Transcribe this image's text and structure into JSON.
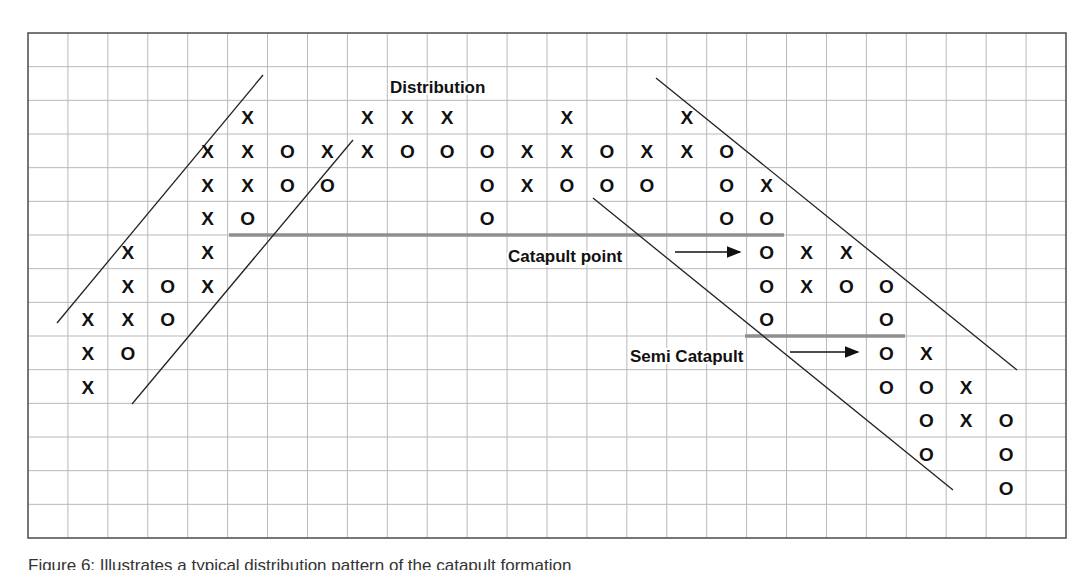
{
  "chart_data": {
    "type": "point-and-figure",
    "title": "",
    "grid": {
      "left": 28,
      "top": 33,
      "right": 1066,
      "bottom": 538,
      "columns": 26,
      "rows": 15,
      "line_color": "#b9b9b9",
      "border_color": "#555555"
    },
    "columns": [
      {
        "col": 1,
        "marks": [
          {
            "r": 8,
            "m": "X"
          },
          {
            "r": 9,
            "m": "X"
          },
          {
            "r": 10,
            "m": "X"
          }
        ]
      },
      {
        "col": 2,
        "marks": [
          {
            "r": 6,
            "m": "X"
          },
          {
            "r": 7,
            "m": "X"
          },
          {
            "r": 8,
            "m": "X"
          },
          {
            "r": 9,
            "m": "O"
          }
        ]
      },
      {
        "col": 3,
        "marks": [
          {
            "r": 7,
            "m": "O"
          },
          {
            "r": 8,
            "m": "O"
          }
        ]
      },
      {
        "col": 4,
        "marks": [
          {
            "r": 3,
            "m": "X"
          },
          {
            "r": 4,
            "m": "X"
          },
          {
            "r": 5,
            "m": "X"
          },
          {
            "r": 6,
            "m": "X"
          },
          {
            "r": 7,
            "m": "X"
          }
        ]
      },
      {
        "col": 5,
        "marks": [
          {
            "r": 2,
            "m": "X"
          },
          {
            "r": 3,
            "m": "X"
          },
          {
            "r": 4,
            "m": "X"
          },
          {
            "r": 5,
            "m": "O"
          }
        ]
      },
      {
        "col": 6,
        "marks": [
          {
            "r": 3,
            "m": "O"
          },
          {
            "r": 4,
            "m": "O"
          }
        ]
      },
      {
        "col": 7,
        "marks": [
          {
            "r": 3,
            "m": "X"
          },
          {
            "r": 4,
            "m": "O"
          }
        ]
      },
      {
        "col": 8,
        "marks": [
          {
            "r": 2,
            "m": "X"
          },
          {
            "r": 3,
            "m": "X"
          }
        ]
      },
      {
        "col": 9,
        "marks": [
          {
            "r": 2,
            "m": "X"
          },
          {
            "r": 3,
            "m": "O"
          }
        ]
      },
      {
        "col": 10,
        "marks": [
          {
            "r": 2,
            "m": "X"
          },
          {
            "r": 3,
            "m": "O"
          }
        ]
      },
      {
        "col": 11,
        "marks": [
          {
            "r": 3,
            "m": "O"
          },
          {
            "r": 4,
            "m": "O"
          },
          {
            "r": 5,
            "m": "O"
          }
        ]
      },
      {
        "col": 12,
        "marks": [
          {
            "r": 3,
            "m": "X"
          },
          {
            "r": 4,
            "m": "X"
          }
        ]
      },
      {
        "col": 13,
        "marks": [
          {
            "r": 2,
            "m": "X"
          },
          {
            "r": 3,
            "m": "X"
          },
          {
            "r": 4,
            "m": "O"
          }
        ]
      },
      {
        "col": 14,
        "marks": [
          {
            "r": 3,
            "m": "O"
          },
          {
            "r": 4,
            "m": "O"
          }
        ]
      },
      {
        "col": 15,
        "marks": [
          {
            "r": 3,
            "m": "X"
          },
          {
            "r": 4,
            "m": "O"
          }
        ]
      },
      {
        "col": 16,
        "marks": [
          {
            "r": 2,
            "m": "X"
          },
          {
            "r": 3,
            "m": "X"
          }
        ]
      },
      {
        "col": 17,
        "marks": [
          {
            "r": 3,
            "m": "O"
          },
          {
            "r": 4,
            "m": "O"
          },
          {
            "r": 5,
            "m": "O"
          }
        ]
      },
      {
        "col": 18,
        "marks": [
          {
            "r": 4,
            "m": "X"
          },
          {
            "r": 5,
            "m": "O"
          },
          {
            "r": 6,
            "m": "O"
          },
          {
            "r": 7,
            "m": "O"
          },
          {
            "r": 8,
            "m": "O"
          }
        ]
      },
      {
        "col": 19,
        "marks": [
          {
            "r": 6,
            "m": "X"
          },
          {
            "r": 7,
            "m": "X"
          }
        ]
      },
      {
        "col": 20,
        "marks": [
          {
            "r": 6,
            "m": "X"
          },
          {
            "r": 7,
            "m": "O"
          }
        ]
      },
      {
        "col": 21,
        "marks": [
          {
            "r": 7,
            "m": "O"
          },
          {
            "r": 8,
            "m": "O"
          },
          {
            "r": 9,
            "m": "O"
          },
          {
            "r": 10,
            "m": "O"
          }
        ]
      },
      {
        "col": 22,
        "marks": [
          {
            "r": 9,
            "m": "X"
          },
          {
            "r": 10,
            "m": "O"
          },
          {
            "r": 11,
            "m": "O"
          },
          {
            "r": 12,
            "m": "O"
          }
        ]
      },
      {
        "col": 23,
        "marks": [
          {
            "r": 10,
            "m": "X"
          },
          {
            "r": 11,
            "m": "X"
          }
        ]
      },
      {
        "col": 24,
        "marks": [
          {
            "r": 11,
            "m": "O"
          },
          {
            "r": 12,
            "m": "O"
          },
          {
            "r": 13,
            "m": "O"
          }
        ]
      }
    ],
    "trendlines": [
      {
        "name": "uptrend-upper",
        "x1": 57,
        "y1": 323,
        "x2": 263,
        "y2": 75
      },
      {
        "name": "uptrend-lower",
        "x1": 132,
        "y1": 404,
        "x2": 353,
        "y2": 140
      },
      {
        "name": "downtrend-upper",
        "x1": 656,
        "y1": 78,
        "x2": 1017,
        "y2": 370
      },
      {
        "name": "downtrend-lower",
        "x1": 593,
        "y1": 198,
        "x2": 953,
        "y2": 490
      }
    ],
    "support_lines": [
      {
        "name": "catapult-support",
        "x1": 229,
        "x2": 784,
        "y": 235,
        "color": "#8f8f8f"
      },
      {
        "name": "semi-catapult-support",
        "x1": 745,
        "x2": 905,
        "y": 336,
        "color": "#8f8f8f"
      }
    ],
    "annotations": [
      {
        "name": "distribution-label",
        "text": "Distribution",
        "x": 390,
        "y": 93
      },
      {
        "name": "catapult-point-label",
        "text": "Catapult point",
        "x": 508,
        "y": 262,
        "arrow": {
          "x1": 675,
          "x2": 740,
          "y": 252
        }
      },
      {
        "name": "semi-catapult-label",
        "text": "Semi Catapult",
        "x": 630,
        "y": 362,
        "arrow": {
          "x1": 790,
          "x2": 858,
          "y": 352
        }
      }
    ],
    "xlabel": "",
    "ylabel": ""
  },
  "caption": "Figure 6: Illustrates a typical distribution pattern of the catapult formation"
}
